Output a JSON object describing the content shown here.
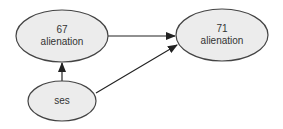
{
  "diagram": {
    "type": "path-diagram",
    "colors": {
      "node_fill": "#ececec",
      "node_stroke": "#444444",
      "edge": "#222222",
      "text": "#333333"
    },
    "nodes": [
      {
        "id": "alienation67",
        "line1": "67",
        "line2": "alienation",
        "cx": 62,
        "cy": 36,
        "rx": 46,
        "ry": 26
      },
      {
        "id": "alienation71",
        "line1": "71",
        "line2": "alienation",
        "cx": 222,
        "cy": 35,
        "rx": 46,
        "ry": 26
      },
      {
        "id": "ses",
        "line1": "ses",
        "line2": "",
        "cx": 62,
        "cy": 101,
        "rx": 34,
        "ry": 20
      }
    ],
    "edges": [
      {
        "from": "alienation67",
        "to": "alienation71"
      },
      {
        "from": "ses",
        "to": "alienation67"
      },
      {
        "from": "ses",
        "to": "alienation71"
      }
    ]
  }
}
